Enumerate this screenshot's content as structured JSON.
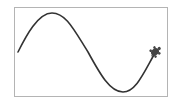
{
  "canvas": {
    "border_color": "#b4b4b4",
    "background": "#ffffff"
  },
  "drawing": {
    "shape": "sine-wave",
    "stroke_color": "#333333",
    "stroke_width": 1.6,
    "start_point": [
      18,
      52
    ],
    "peak_point": [
      52,
      13
    ],
    "trough_point": [
      123,
      92
    ],
    "end_point": [
      155,
      52
    ],
    "cycles": 1
  },
  "turtle": {
    "icon": "turtle-icon",
    "color": "#444444",
    "position": [
      155,
      52
    ]
  }
}
